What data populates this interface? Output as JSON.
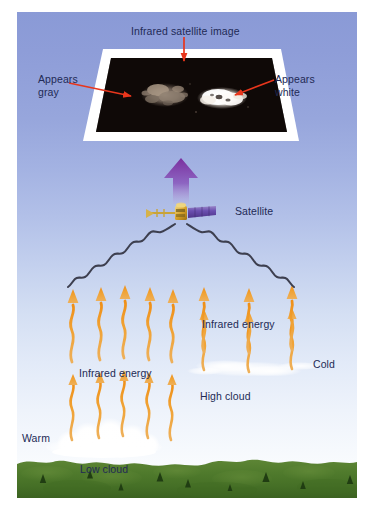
{
  "figure": {
    "title": "Infrared satellite image",
    "background_color": "#ffffff",
    "sky_top_color": "#8a9ad6",
    "sky_bottom_color": "#ffffff",
    "ground_color": "#4e7a2e"
  },
  "labels": {
    "title": "Infrared satellite image",
    "appears_gray": "Appears\ngray",
    "appears_white": "Appears\nwhite",
    "satellite": "Satellite",
    "infrared_energy_high": "Infrared energy",
    "infrared_energy_low": "Infrared energy",
    "cold": "Cold",
    "warm": "Warm",
    "high_cloud": "High cloud",
    "low_cloud": "Low cloud"
  },
  "colors": {
    "label_text": "#222a55",
    "pointer_arrow": "#e8361c",
    "signal_arrow": "#7a2f9e",
    "infrared_arrow": "#f0a030",
    "wave_line": "#3d3f4f",
    "plate_border": "#ffffff",
    "image_background": "#0a0606",
    "gray_patch": "#9b8c80",
    "white_patch": "#f6f3ef",
    "satellite_body": "#d6a12a",
    "satellite_panel": "#6b4fb0",
    "cloud": "#ffffff"
  },
  "satellite_image": {
    "caption": "Infrared satellite image",
    "patches": [
      {
        "name": "gray-patch",
        "appearance": "Appears gray",
        "temperature": "Warm",
        "source": "Low cloud"
      },
      {
        "name": "white-patch",
        "appearance": "Appears white",
        "temperature": "Cold",
        "source": "High cloud"
      }
    ]
  },
  "annotations": {
    "pointer_to_image": "Infrared satellite image",
    "pointer_to_gray": "Appears gray",
    "pointer_to_white": "Appears white"
  },
  "infrared_arrows": {
    "low_cloud_group_count": 5,
    "high_cloud_group_count": 3,
    "upper_group_count": 8
  }
}
